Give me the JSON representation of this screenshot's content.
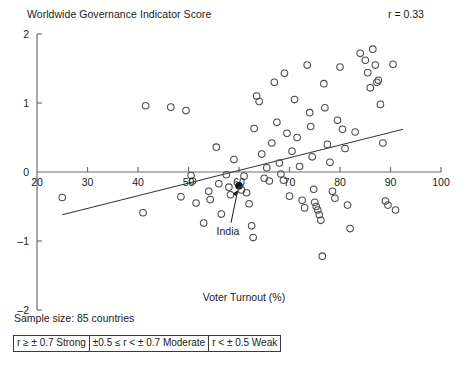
{
  "header": {
    "title": "Worldwide Governance Indicator Score",
    "r_label": "r = 0.33"
  },
  "footer": {
    "sample_size": "Sample size: 85 countries",
    "legend_cells": [
      "r ≥ ± 0.7 Strong",
      "±0.5 ≤ r < ± 0.7 Moderate",
      "r < ± 0.5 Weak"
    ]
  },
  "chart_data": {
    "type": "scatter",
    "title": "Worldwide Governance Indicator Score",
    "xlabel": "Voter Turnout (%)",
    "ylabel": "Worldwide Governance Indicator Score",
    "xlim": [
      20,
      100
    ],
    "ylim": [
      -2,
      2
    ],
    "xticks": [
      20,
      30,
      40,
      50,
      60,
      70,
      80,
      90,
      100
    ],
    "yticks": [
      -2,
      -1,
      0,
      1,
      2
    ],
    "grid": false,
    "legend_position": "none",
    "correlation": 0.33,
    "correlation_label": "r = 0.33",
    "sample_size": 85,
    "annotations": [
      {
        "label": "India",
        "x": 60.0,
        "y": -0.2,
        "filled": true
      }
    ],
    "trendline": {
      "x0": 25.0,
      "y0": -0.62,
      "x1": 92.5,
      "y1": 0.62
    },
    "points": [
      {
        "x": 25.0,
        "y": -0.37
      },
      {
        "x": 41.0,
        "y": -0.59
      },
      {
        "x": 41.5,
        "y": 0.96
      },
      {
        "x": 46.5,
        "y": 0.94
      },
      {
        "x": 48.5,
        "y": -0.36
      },
      {
        "x": 49.5,
        "y": 0.89
      },
      {
        "x": 50.5,
        "y": -0.05
      },
      {
        "x": 50.8,
        "y": -0.13
      },
      {
        "x": 51.5,
        "y": -0.45
      },
      {
        "x": 53.0,
        "y": -0.74
      },
      {
        "x": 54.0,
        "y": -0.28
      },
      {
        "x": 54.3,
        "y": -0.4
      },
      {
        "x": 55.5,
        "y": 0.36
      },
      {
        "x": 56.0,
        "y": -0.17
      },
      {
        "x": 56.5,
        "y": -0.61
      },
      {
        "x": 57.5,
        "y": -0.04
      },
      {
        "x": 58.0,
        "y": -0.22
      },
      {
        "x": 58.3,
        "y": -0.33
      },
      {
        "x": 59.0,
        "y": 0.18
      },
      {
        "x": 60.0,
        "y": -0.2,
        "filled": true
      },
      {
        "x": 60.5,
        "y": -0.26
      },
      {
        "x": 61.0,
        "y": -0.06
      },
      {
        "x": 61.5,
        "y": -0.3
      },
      {
        "x": 62.0,
        "y": -0.46
      },
      {
        "x": 62.5,
        "y": -0.78
      },
      {
        "x": 62.8,
        "y": -0.95
      },
      {
        "x": 63.0,
        "y": 0.63
      },
      {
        "x": 63.5,
        "y": 1.1
      },
      {
        "x": 64.0,
        "y": 1.02
      },
      {
        "x": 64.5,
        "y": 0.26
      },
      {
        "x": 65.0,
        "y": -0.09
      },
      {
        "x": 65.5,
        "y": 0.06
      },
      {
        "x": 66.0,
        "y": -0.13
      },
      {
        "x": 66.5,
        "y": 0.42
      },
      {
        "x": 67.0,
        "y": 1.3
      },
      {
        "x": 67.5,
        "y": 0.72
      },
      {
        "x": 68.0,
        "y": 0.13
      },
      {
        "x": 68.3,
        "y": -0.03
      },
      {
        "x": 68.8,
        "y": -0.12
      },
      {
        "x": 69.0,
        "y": 1.43
      },
      {
        "x": 69.5,
        "y": 0.56
      },
      {
        "x": 70.0,
        "y": -0.35
      },
      {
        "x": 70.5,
        "y": 0.3
      },
      {
        "x": 71.0,
        "y": 1.05
      },
      {
        "x": 71.5,
        "y": 0.5
      },
      {
        "x": 72.0,
        "y": 0.08
      },
      {
        "x": 72.5,
        "y": -0.41
      },
      {
        "x": 73.0,
        "y": -0.52
      },
      {
        "x": 73.5,
        "y": 1.55
      },
      {
        "x": 74.0,
        "y": 0.86
      },
      {
        "x": 74.2,
        "y": 0.66
      },
      {
        "x": 74.5,
        "y": 0.22
      },
      {
        "x": 74.8,
        "y": -0.25
      },
      {
        "x": 75.0,
        "y": -0.44
      },
      {
        "x": 75.3,
        "y": -0.5
      },
      {
        "x": 75.6,
        "y": -0.55
      },
      {
        "x": 75.9,
        "y": -0.62
      },
      {
        "x": 76.2,
        "y": -0.7
      },
      {
        "x": 76.5,
        "y": -1.22
      },
      {
        "x": 76.8,
        "y": 1.28
      },
      {
        "x": 77.0,
        "y": 0.93
      },
      {
        "x": 77.5,
        "y": 0.4
      },
      {
        "x": 78.0,
        "y": 0.14
      },
      {
        "x": 78.5,
        "y": -0.28
      },
      {
        "x": 79.0,
        "y": -0.38
      },
      {
        "x": 79.5,
        "y": 0.75
      },
      {
        "x": 80.0,
        "y": 1.52
      },
      {
        "x": 80.5,
        "y": 0.62
      },
      {
        "x": 81.0,
        "y": 0.34
      },
      {
        "x": 81.5,
        "y": -0.48
      },
      {
        "x": 82.0,
        "y": -0.82
      },
      {
        "x": 83.0,
        "y": 0.58
      },
      {
        "x": 84.0,
        "y": 1.72
      },
      {
        "x": 85.0,
        "y": 1.62
      },
      {
        "x": 85.5,
        "y": 1.44
      },
      {
        "x": 86.0,
        "y": 1.22
      },
      {
        "x": 86.5,
        "y": 1.78
      },
      {
        "x": 87.0,
        "y": 1.55
      },
      {
        "x": 87.3,
        "y": 1.3
      },
      {
        "x": 87.6,
        "y": 1.33
      },
      {
        "x": 88.0,
        "y": 0.98
      },
      {
        "x": 88.5,
        "y": 0.42
      },
      {
        "x": 89.0,
        "y": -0.42
      },
      {
        "x": 89.5,
        "y": -0.48
      },
      {
        "x": 90.5,
        "y": 1.56
      },
      {
        "x": 91.0,
        "y": -0.55
      }
    ]
  }
}
